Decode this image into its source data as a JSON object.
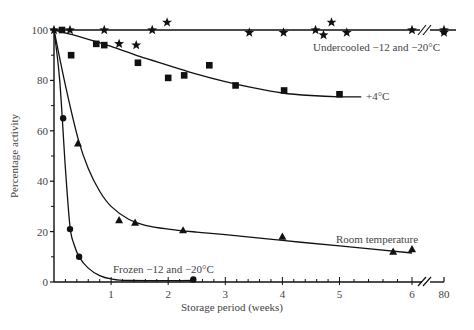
{
  "chart_data": {
    "type": "scatter",
    "title": "",
    "xlabel": "Storage period (weeks)",
    "ylabel": "Percentage activity",
    "xlim": [
      0,
      6.4
    ],
    "ylim": [
      0,
      100
    ],
    "x_break": {
      "after": 6,
      "label_after": "80"
    },
    "xticks": [
      "1",
      "2",
      "3",
      "4",
      "5",
      "6",
      "80"
    ],
    "yticks": [
      "0",
      "20",
      "40",
      "60",
      "80",
      "100"
    ],
    "grid": false,
    "legend": "inline curve labels",
    "series": [
      {
        "name": "Undercooled −12 and −20°C",
        "marker": "star",
        "points": [
          [
            0.0,
            100
          ],
          [
            0.28,
            100
          ],
          [
            0.88,
            100
          ],
          [
            1.14,
            94.5
          ],
          [
            1.44,
            94
          ],
          [
            1.72,
            100
          ],
          [
            1.98,
            103
          ],
          [
            3.42,
            99
          ],
          [
            4.02,
            99
          ],
          [
            4.58,
            100
          ],
          [
            4.72,
            98
          ],
          [
            4.86,
            103
          ],
          [
            5.1,
            99
          ],
          [
            6.0,
            100
          ],
          [
            "80",
            100
          ],
          [
            "80",
            99
          ]
        ],
        "fit": [
          [
            0,
            100
          ],
          [
            6.45,
            100
          ]
        ]
      },
      {
        "name": "+4°C",
        "marker": "square",
        "points": [
          [
            0.14,
            100
          ],
          [
            0.3,
            90
          ],
          [
            0.74,
            94.5
          ],
          [
            0.88,
            94
          ],
          [
            1.47,
            87
          ],
          [
            2.0,
            81
          ],
          [
            2.28,
            82
          ],
          [
            2.72,
            86
          ],
          [
            3.18,
            78
          ],
          [
            4.03,
            76
          ],
          [
            5.0,
            74.5
          ]
        ],
        "fit": [
          [
            0,
            100
          ],
          [
            0.5,
            97
          ],
          [
            1,
            93.5
          ],
          [
            1.5,
            89.5
          ],
          [
            2,
            86
          ],
          [
            2.5,
            82.5
          ],
          [
            3,
            79.5
          ],
          [
            3.5,
            77
          ],
          [
            4,
            75
          ],
          [
            4.5,
            74
          ],
          [
            5,
            73.5
          ],
          [
            5.3,
            73.5
          ]
        ]
      },
      {
        "name": "Room temperature",
        "marker": "triangle",
        "points": [
          [
            0.42,
            55
          ],
          [
            1.14,
            24.5
          ],
          [
            1.42,
            23.5
          ],
          [
            2.26,
            20.5
          ],
          [
            4.0,
            18
          ],
          [
            5.74,
            12
          ],
          [
            6.0,
            13
          ]
        ],
        "fit": [
          [
            0,
            100
          ],
          [
            0.2,
            78
          ],
          [
            0.42,
            57
          ],
          [
            0.6,
            45
          ],
          [
            0.8,
            36
          ],
          [
            1.0,
            30
          ],
          [
            1.3,
            25
          ],
          [
            1.6,
            22.5
          ],
          [
            2.0,
            21
          ],
          [
            2.5,
            19.8
          ],
          [
            3,
            18.8
          ],
          [
            4,
            16.5
          ],
          [
            5,
            14.3
          ],
          [
            6,
            11.5
          ]
        ]
      },
      {
        "name": "Frozen −12 and −20°C",
        "marker": "circle",
        "points": [
          [
            0.16,
            65
          ],
          [
            0.28,
            21
          ],
          [
            0.44,
            10
          ],
          [
            2.44,
            1
          ]
        ],
        "fit": [
          [
            0,
            100
          ],
          [
            0.1,
            80
          ],
          [
            0.2,
            45
          ],
          [
            0.28,
            22
          ],
          [
            0.35,
            15
          ],
          [
            0.44,
            10
          ],
          [
            0.6,
            5.5
          ],
          [
            0.8,
            2.5
          ],
          [
            1.0,
            1.2
          ],
          [
            1.3,
            0.6
          ],
          [
            2.44,
            0.6
          ]
        ]
      }
    ],
    "annotations": [
      {
        "text": "Undercooled −12 and −20°C",
        "near": "top right"
      },
      {
        "text": "+4°C",
        "near": "end of +4°C curve"
      },
      {
        "text": "Room temperature",
        "near": "lower right above curve"
      },
      {
        "text": "Frozen −12 and −20°C",
        "near": "bottom center"
      }
    ]
  },
  "labels": {
    "xlabel": "Storage period (weeks)",
    "ylabel": "Percentage activity",
    "undercooled": "Undercooled −12 and −20°C",
    "plus4": "+4°C",
    "room": "Room temperature",
    "frozen": "Frozen −12 and −20°C"
  }
}
